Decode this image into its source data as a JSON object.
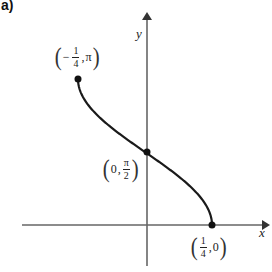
{
  "figure": {
    "part_label": "a)",
    "axes": {
      "x_label": "x",
      "y_label": "y"
    },
    "points": [
      {
        "id": "left-end",
        "neg": "−",
        "num": "1",
        "den": "4",
        "sep": ",",
        "y": "π",
        "px": 78,
        "py": 79
      },
      {
        "id": "y-intercept",
        "x": "0",
        "sep": ",",
        "num": "π",
        "den": "2",
        "px": 147,
        "py": 152
      },
      {
        "id": "right-end",
        "num": "1",
        "den": "4",
        "sep": ",",
        "y": "0",
        "px": 212,
        "py": 225
      }
    ],
    "curve": {
      "function": "y = arccos(4x)",
      "domain": [
        -0.25,
        0.25
      ],
      "range": [
        0,
        3.14159
      ]
    },
    "colors": {
      "curve": "#1a1a1a",
      "axes": "#555555"
    }
  },
  "chart_data": {
    "type": "line",
    "title": "a)",
    "xlabel": "x",
    "ylabel": "y",
    "series": [
      {
        "name": "y = arccos(4x)",
        "x": [
          -0.25,
          -0.125,
          0,
          0.125,
          0.25
        ],
        "values": [
          3.14159,
          2.0944,
          1.5708,
          1.0472,
          0
        ]
      }
    ],
    "annotations": [
      "(−1/4, π)",
      "(0, π/2)",
      "(1/4, 0)"
    ],
    "grid": false
  }
}
